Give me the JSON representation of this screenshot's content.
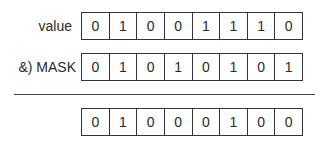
{
  "rows": [
    {
      "label": "value",
      "bits": [
        "0",
        "1",
        "0",
        "0",
        "1",
        "1",
        "1",
        "0"
      ]
    },
    {
      "label": "&) MASK",
      "bits": [
        "0",
        "1",
        "0",
        "1",
        "0",
        "1",
        "0",
        "1"
      ]
    },
    {
      "label": "",
      "bits": [
        "0",
        "1",
        "0",
        "0",
        "0",
        "1",
        "0",
        "0"
      ]
    }
  ]
}
